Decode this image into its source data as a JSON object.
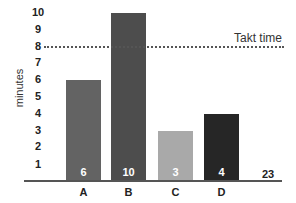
{
  "chart_data": {
    "type": "bar",
    "title": "",
    "xlabel": "",
    "ylabel": "minutes",
    "ylim": [
      0,
      10
    ],
    "yticks": [
      1,
      2,
      3,
      4,
      5,
      6,
      7,
      8,
      9,
      10
    ],
    "categories": [
      "A",
      "B",
      "C",
      "D"
    ],
    "values": [
      6,
      10,
      3,
      4
    ],
    "bar_colors": [
      "#636363",
      "#4d4d4d",
      "#a9a9a9",
      "#262626"
    ],
    "data_labels": [
      "6",
      "10",
      "3",
      "4"
    ],
    "reference_line": {
      "label": "Takt time",
      "value": 8,
      "style": "dotted",
      "color": "#555555"
    },
    "annotations": [
      {
        "text": "23",
        "position": "right of last bar, on baseline",
        "meaning": "total"
      }
    ],
    "grid": false,
    "legend": null
  },
  "labels": {
    "ylabel": "minutes",
    "takt": "Takt time",
    "total": "23"
  }
}
